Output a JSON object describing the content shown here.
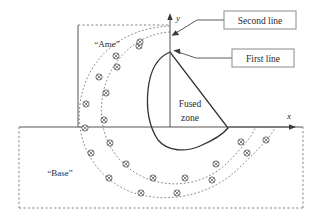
{
  "figure": {
    "regions": {
      "web_label": "“Ame”",
      "base_label": "“Base”",
      "fused_zone_line1": "Fused",
      "fused_zone_line2": "zone"
    },
    "axes": {
      "x_label": "x",
      "y_label": "y",
      "origin_x": 170,
      "origin_y": 127
    },
    "callouts": [
      {
        "id": "second-line",
        "label": "Second line",
        "box": {
          "x": 224,
          "y": 11,
          "width": 72,
          "height": 18
        },
        "leader": "M296,20 L224,20 L198,20 L175,33",
        "arrow_tip": {
          "x": 172,
          "y": 34
        }
      },
      {
        "id": "first-line",
        "label": "First line",
        "box": {
          "x": 232,
          "y": 49,
          "width": 62,
          "height": 18
        },
        "leader": "M294,58 L232,58 L196,58 L177,52",
        "arrow_tip": {
          "x": 173,
          "y": 51
        }
      }
    ],
    "geometry": {
      "base_rect": {
        "left": 19,
        "top": 127,
        "right": 303,
        "bottom": 208
      },
      "web_rect": {
        "left": 78,
        "top": 25,
        "right": 170,
        "bottom": 127
      },
      "fused_zone_apex": {
        "x": 170,
        "y": 52
      },
      "fused_zone_right": {
        "x": 228,
        "y": 128
      },
      "x_axis_end": {
        "x": 296,
        "y": 127
      },
      "y_axis_end": {
        "x": 170,
        "y": 14
      }
    },
    "isotherm_arcs": [
      {
        "name": "inner-isotherm",
        "path": "M170,30 C132,32 104,62 100,100 C96,135 112,165 142,180 C172,194 208,188 230,166 C248,148 256,136 258,128",
        "marker_count": 10
      },
      {
        "name": "outer-isotherm",
        "path": "M170,25 C120,27 84,58 78,104 C73,146 94,180 130,194 C168,208 214,198 242,170 C264,148 274,136 278,128",
        "marker_count": 11
      }
    ],
    "marker_symbol": "circle-with-cross",
    "colors": {
      "line": "#555555",
      "heavy_line": "#333333",
      "dashed": "#777777",
      "marker": "#4d4d4d",
      "text": "#2b2b2b",
      "box_border": "#8a8a8a",
      "background": "#ffffff"
    }
  }
}
